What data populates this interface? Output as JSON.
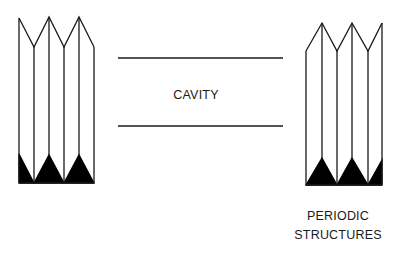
{
  "diagram": {
    "cavity_label": "CAVITY",
    "structures_label_line1": "PERIODIC",
    "structures_label_line2": "STRUCTURES",
    "colors": {
      "stroke": "#1a1a1a",
      "fill": "#000000",
      "background": "#ffffff"
    },
    "left_structure": {
      "columns": 3,
      "vertical_lines_x": [
        19,
        34,
        49,
        64,
        79,
        94
      ],
      "top_zigzag": [
        [
          19,
          18
        ],
        [
          34,
          47
        ],
        [
          49,
          17
        ],
        [
          64,
          47
        ],
        [
          79,
          17
        ],
        [
          94,
          47
        ]
      ],
      "bottom_y": 183,
      "triangle_apex_y": 155
    },
    "right_structure": {
      "columns": 3,
      "vertical_lines_x": [
        306,
        322,
        337,
        352,
        368,
        382
      ],
      "top_zigzag": [
        [
          306,
          51
        ],
        [
          322,
          23
        ],
        [
          337,
          51
        ],
        [
          352,
          23
        ],
        [
          368,
          51
        ],
        [
          382,
          23
        ]
      ],
      "bottom_y": 185,
      "triangle_apex_y": 158
    },
    "cavity_lines": {
      "x_start": 118,
      "x_end": 283,
      "top_y": 58,
      "bottom_y": 126
    }
  }
}
